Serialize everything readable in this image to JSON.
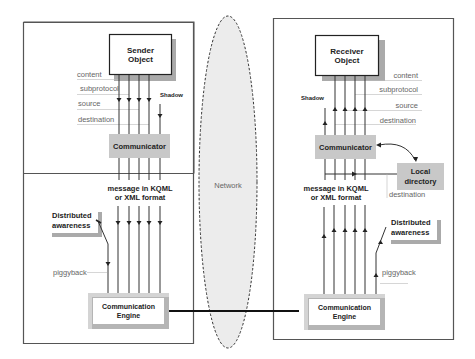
{
  "network": {
    "label": "Network"
  },
  "sender": {
    "object_title_line1": "Sender",
    "object_title_line2": "Object",
    "fields": [
      "content",
      "subprotocol",
      "source",
      "destination"
    ],
    "shadow_label": "Shadow",
    "communicator_label": "Communicator",
    "message_line1": "message in KQML",
    "message_line2": "or XML format",
    "awareness_line1": "Distributed",
    "awareness_line2": "awareness",
    "piggyback_label": "piggyback",
    "engine_line1": "Communication",
    "engine_line2": "Engine"
  },
  "receiver": {
    "object_title_line1": "Receiver",
    "object_title_line2": "Object",
    "fields": [
      "content",
      "subprotocol",
      "source",
      "destination"
    ],
    "shadow_label": "Shadow",
    "communicator_label": "Communicator",
    "directory_line1": "Local",
    "directory_line2": "directory",
    "directory_destination_label": "destination",
    "message_line1": "message in KQML",
    "message_line2": "or XML format",
    "awareness_line1": "Distributed",
    "awareness_line2": "awareness",
    "piggyback_label": "piggyback",
    "engine_line1": "Communication",
    "engine_line2": "Engine"
  },
  "colors": {
    "panel_border": "#555555",
    "gray_box": "#c8c8c8",
    "shadow_gray": "#a8a8a8",
    "network_fill": "#ececec",
    "line": "#333333"
  }
}
